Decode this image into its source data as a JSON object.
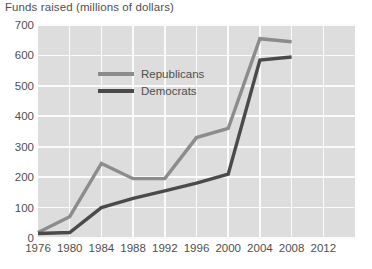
{
  "chart_data": {
    "type": "line",
    "title": "Funds raised (millions of dollars)",
    "xlabel": "",
    "ylabel": "",
    "ylim": [
      0,
      700
    ],
    "ytick_step": 100,
    "yticks": [
      "0",
      "100",
      "200",
      "300",
      "400",
      "500",
      "600",
      "700"
    ],
    "categories": [
      "1976",
      "1980",
      "1984",
      "1988",
      "1992",
      "1996",
      "2000",
      "2004",
      "2008",
      "2012"
    ],
    "x": [
      1976,
      1980,
      1984,
      1988,
      1992,
      1996,
      2000,
      2004,
      2008,
      2012
    ],
    "grid": true,
    "legend_position": "top-left-inside",
    "series": [
      {
        "name": "Republicans",
        "color": "#8c8c8c",
        "values": [
          18,
          70,
          245,
          195,
          195,
          330,
          360,
          655,
          645,
          null
        ]
      },
      {
        "name": "Democrats",
        "color": "#4a4a4a",
        "values": [
          15,
          18,
          100,
          130,
          155,
          180,
          210,
          585,
          595,
          null
        ]
      }
    ]
  },
  "colors": {
    "plot_background": "#dddddd",
    "gridline": "#fbfbfb",
    "page_background": "#ffffff",
    "text": "#4f4f4f",
    "republicans": "#8c8c8c",
    "democrats": "#4a4a4a"
  },
  "legend": {
    "items": [
      {
        "label": "Republicans",
        "swatch_name": "republicans-line-swatch"
      },
      {
        "label": "Democrats",
        "swatch_name": "democrats-line-swatch"
      }
    ]
  }
}
